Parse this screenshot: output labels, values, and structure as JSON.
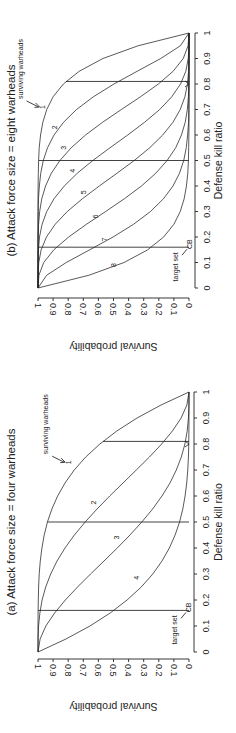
{
  "chart_data": [
    {
      "id": "panel-b",
      "type": "line",
      "title": "(b) Attack force size = eight warheads",
      "xlabel": "Defense kill ratio",
      "ylabel": "Survival probability",
      "xlim": [
        0,
        1
      ],
      "ylim": [
        0,
        1
      ],
      "xticks": [
        "0",
        "0.1",
        "0.2",
        "0.3",
        "0.4",
        "0.5",
        "0.6",
        "0.7",
        "0.8",
        "0.9",
        "1"
      ],
      "yticks": [
        "0",
        "0.1",
        "0.2",
        "0.3",
        "0.4",
        "0.5",
        "0.6",
        "0.7",
        "0.8",
        "0.9",
        "1"
      ],
      "grid": false,
      "x": [
        0,
        0.05,
        0.1,
        0.15,
        0.2,
        0.25,
        0.3,
        0.35,
        0.4,
        0.45,
        0.5,
        0.55,
        0.6,
        0.65,
        0.7,
        0.75,
        0.8,
        0.85,
        0.9,
        0.95,
        1
      ],
      "series": [
        {
          "name": "1",
          "values": [
            1,
            1,
            1,
            1,
            1,
            1,
            0.9999,
            0.9998,
            0.9993,
            0.998,
            0.996,
            0.992,
            0.983,
            0.968,
            0.942,
            0.9,
            0.832,
            0.727,
            0.57,
            0.337,
            0
          ]
        },
        {
          "name": "2",
          "values": [
            1,
            1,
            1,
            1,
            0.9999,
            0.9996,
            0.9987,
            0.997,
            0.991,
            0.982,
            0.965,
            0.937,
            0.894,
            0.831,
            0.745,
            0.633,
            0.497,
            0.343,
            0.187,
            0.057,
            0
          ]
        },
        {
          "name": "3",
          "values": [
            1,
            1,
            1,
            0.9997,
            0.999,
            0.996,
            0.989,
            0.975,
            0.95,
            0.912,
            0.855,
            0.78,
            0.685,
            0.572,
            0.448,
            0.321,
            0.203,
            0.105,
            0.038,
            0.006,
            0
          ]
        },
        {
          "name": "4",
          "values": [
            1,
            1,
            0.9996,
            0.997,
            0.99,
            0.973,
            0.942,
            0.894,
            0.826,
            0.74,
            0.637,
            0.523,
            0.406,
            0.294,
            0.194,
            0.114,
            0.056,
            0.021,
            0.005,
            0.0004,
            0
          ]
        },
        {
          "name": "5",
          "values": [
            1,
            0.9996,
            0.995,
            0.979,
            0.944,
            0.886,
            0.806,
            0.706,
            0.594,
            0.477,
            0.363,
            0.26,
            0.174,
            0.106,
            0.058,
            0.027,
            0.01,
            0.003,
            0.0004,
            0,
            0
          ]
        },
        {
          "name": "6",
          "values": [
            1,
            0.994,
            0.962,
            0.895,
            0.797,
            0.679,
            0.552,
            0.428,
            0.315,
            0.22,
            0.145,
            0.088,
            0.05,
            0.025,
            0.011,
            0.004,
            0.001,
            0.0003,
            0,
            0,
            0
          ]
        },
        {
          "name": "7",
          "values": [
            1,
            0.943,
            0.813,
            0.657,
            0.503,
            0.367,
            0.255,
            0.169,
            0.106,
            0.063,
            0.035,
            0.018,
            0.009,
            0.003,
            0.0013,
            0.0004,
            0.0001,
            0,
            0,
            0,
            0
          ]
        },
        {
          "name": "8",
          "values": [
            1,
            0.663,
            0.43,
            0.273,
            0.168,
            0.1,
            0.058,
            0.032,
            0.017,
            0.008,
            0.004,
            0.002,
            0.0007,
            0.0002,
            0.0001,
            0,
            0,
            0,
            0,
            0,
            0
          ]
        }
      ],
      "reference_lines": [
        {
          "x": 0.16,
          "y_top": 1.0
        },
        {
          "x": 0.5,
          "y_top": 0.996
        },
        {
          "x": 0.81,
          "y_top": 0.815
        }
      ],
      "curve_labels": [
        {
          "text": "1",
          "x": 0.71,
          "y": 0.97
        },
        {
          "text": "2",
          "x": 0.63,
          "y": 0.89
        },
        {
          "text": "3",
          "x": 0.55,
          "y": 0.83
        },
        {
          "text": "4",
          "x": 0.46,
          "y": 0.77
        },
        {
          "text": "5",
          "x": 0.375,
          "y": 0.7
        },
        {
          "text": "6",
          "x": 0.28,
          "y": 0.62
        },
        {
          "text": "7",
          "x": 0.19,
          "y": 0.56
        },
        {
          "text": "8",
          "x": 0.09,
          "y": 0.5
        }
      ],
      "annotations": {
        "surviving_warheads": "surviving warheads",
        "target_set": "target set",
        "cb": "CB"
      }
    },
    {
      "id": "panel-a",
      "type": "line",
      "title": "(a) Attack force size = four warheads",
      "xlabel": "Defense kill ratio",
      "ylabel": "Survival probability",
      "xlim": [
        0,
        1
      ],
      "ylim": [
        0,
        1
      ],
      "xticks": [
        "0",
        "0.1",
        "0.2",
        "0.3",
        "0.4",
        "0.5",
        "0.6",
        "0.7",
        "0.8",
        "0.9",
        "1"
      ],
      "yticks": [
        "0",
        "0.1",
        "0.2",
        "0.3",
        "0.4",
        "0.5",
        "0.6",
        "0.7",
        "0.8",
        "0.9",
        "1"
      ],
      "grid": false,
      "x": [
        0,
        0.05,
        0.1,
        0.15,
        0.2,
        0.25,
        0.3,
        0.35,
        0.4,
        0.45,
        0.5,
        0.55,
        0.6,
        0.65,
        0.7,
        0.75,
        0.8,
        0.85,
        0.9,
        0.95,
        1
      ],
      "series": [
        {
          "name": "1",
          "values": [
            1,
            1,
            1,
            0.9995,
            0.998,
            0.996,
            0.992,
            0.985,
            0.974,
            0.959,
            0.9375,
            0.908,
            0.87,
            0.821,
            0.76,
            0.684,
            0.59,
            0.478,
            0.344,
            0.185,
            0
          ]
        },
        {
          "name": "2",
          "values": [
            1,
            0.9995,
            0.9963,
            0.9875,
            0.973,
            0.949,
            0.916,
            0.874,
            0.821,
            0.759,
            0.6875,
            0.609,
            0.525,
            0.437,
            0.349,
            0.262,
            0.181,
            0.11,
            0.052,
            0.014,
            0
          ]
        },
        {
          "name": "3",
          "values": [
            1,
            0.986,
            0.948,
            0.89,
            0.819,
            0.738,
            0.652,
            0.563,
            0.475,
            0.391,
            0.3125,
            0.241,
            0.179,
            0.126,
            0.084,
            0.051,
            0.027,
            0.012,
            0.0037,
            0.0005,
            0
          ]
        },
        {
          "name": "4",
          "values": [
            1,
            0.815,
            0.656,
            0.522,
            0.41,
            0.316,
            0.24,
            0.179,
            0.13,
            0.092,
            0.0625,
            0.041,
            0.026,
            0.015,
            0.0081,
            0.0039,
            0.0016,
            0.0005,
            0.0001,
            0,
            0
          ]
        }
      ],
      "reference_lines": [
        {
          "x": 0.16,
          "y_top": 0.9993
        },
        {
          "x": 0.5,
          "y_top": 0.9375
        },
        {
          "x": 0.81,
          "y_top": 0.5695
        }
      ],
      "curve_labels": [
        {
          "text": "1",
          "x": 0.73,
          "y": 0.8
        },
        {
          "text": "2",
          "x": 0.575,
          "y": 0.63
        },
        {
          "text": "3",
          "x": 0.44,
          "y": 0.48
        },
        {
          "text": "4",
          "x": 0.285,
          "y": 0.35
        }
      ],
      "annotations": {
        "surviving_warheads": "surviving warheads",
        "target_set": "target set",
        "cb": "CB"
      }
    }
  ]
}
